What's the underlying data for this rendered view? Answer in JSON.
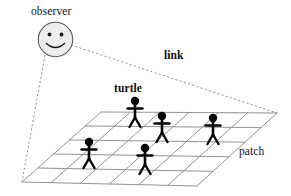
{
  "figure": {
    "background_color": "#ffffff"
  },
  "labels": {
    "observer": "observer",
    "turtle": "turtle",
    "link": "link",
    "patch": "patch"
  },
  "observer": {
    "icon_name": "smiley-face-icon",
    "center_x": 55.5,
    "center_y": 39.5,
    "radius": 17.5,
    "fill_color": "#ededed",
    "stroke_color": "#4d4d4d",
    "eye_color": "#1a1a1a",
    "mouth_color": "#1a1a1a"
  },
  "links": {
    "stroke_color": "#7a7a7a",
    "dash": "2,2",
    "segments": [
      {
        "name": "observer-to-grid-left",
        "x1": 45,
        "y1": 55,
        "x2": 22,
        "y2": 182
      },
      {
        "name": "observer-to-grid-right",
        "x1": 71,
        "y1": 45,
        "x2": 277,
        "y2": 113
      }
    ]
  },
  "grid": {
    "stroke_color": "#8c8c8c",
    "corner_left": {
      "x": 22,
      "y": 182
    },
    "corner_top": {
      "x": 101,
      "y": 112
    },
    "corner_right": {
      "x": 277,
      "y": 113
    },
    "corner_bottom": {
      "x": 197,
      "y": 186
    },
    "rows": 5,
    "cols": 6
  },
  "turtles": [
    {
      "name": "turtle-1",
      "x": 135,
      "y": 101,
      "scale": 1.0
    },
    {
      "name": "turtle-2",
      "x": 162,
      "y": 116,
      "scale": 1.0
    },
    {
      "name": "turtle-3",
      "x": 213,
      "y": 118,
      "scale": 1.0
    },
    {
      "name": "turtle-4",
      "x": 89,
      "y": 142,
      "scale": 1.0
    },
    {
      "name": "turtle-5",
      "x": 145,
      "y": 148,
      "scale": 1.0
    }
  ],
  "turtle_style": {
    "fill_color": "#050505",
    "head_radius": 4.2,
    "body_length": 13,
    "arm_span": 15,
    "leg_spread": 7
  }
}
